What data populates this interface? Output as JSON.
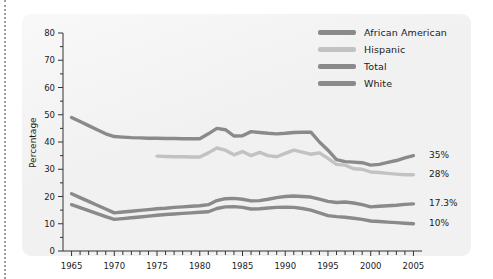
{
  "chart_data": {
    "type": "line",
    "title": "",
    "xlabel": "",
    "ylabel": "Percentage",
    "xlim": [
      1964,
      2006
    ],
    "ylim": [
      0,
      80
    ],
    "yticks": [
      0,
      10,
      20,
      30,
      40,
      50,
      60,
      70,
      80
    ],
    "xticks": [
      1965,
      1970,
      1975,
      1980,
      1985,
      1990,
      1995,
      2000,
      2005
    ],
    "xtick_labels": [
      "1965",
      "1970",
      "1975",
      "1980",
      "1985",
      "1990",
      "1995",
      "2000",
      "2005"
    ],
    "ytick_labels": [
      "0",
      "10",
      "20",
      "30",
      "40",
      "50",
      "60",
      "70",
      "80"
    ],
    "minor_xtick_step": 1,
    "grid": false,
    "legend_position": "top-right",
    "series": [
      {
        "name": "African American",
        "color": "#8a8a8a",
        "end_label": "35%",
        "x": [
          1965,
          1966,
          1967,
          1968,
          1969,
          1970,
          1971,
          1972,
          1973,
          1974,
          1975,
          1976,
          1977,
          1978,
          1979,
          1980,
          1981,
          1982,
          1983,
          1984,
          1985,
          1986,
          1987,
          1988,
          1989,
          1990,
          1991,
          1992,
          1993,
          1994,
          1995,
          1996,
          1997,
          1998,
          1999,
          2000,
          2001,
          2002,
          2003,
          2004,
          2005
        ],
        "y": [
          49.0,
          47.5,
          46.0,
          44.5,
          43.0,
          42.0,
          41.8,
          41.6,
          41.5,
          41.4,
          41.4,
          41.3,
          41.3,
          41.2,
          41.2,
          41.2,
          43.0,
          45.0,
          44.5,
          42.2,
          42.3,
          43.8,
          43.5,
          43.2,
          43.0,
          43.2,
          43.5,
          43.6,
          43.6,
          40.0,
          37.0,
          33.5,
          32.8,
          32.6,
          32.4,
          31.5,
          31.8,
          32.5,
          33.2,
          34.2,
          35.0
        ]
      },
      {
        "name": "Hispanic",
        "color": "#c2c2c2",
        "end_label": "28%",
        "x": [
          1975,
          1976,
          1977,
          1978,
          1979,
          1980,
          1981,
          1982,
          1983,
          1984,
          1985,
          1986,
          1987,
          1988,
          1989,
          1990,
          1991,
          1992,
          1993,
          1994,
          1995,
          1996,
          1997,
          1998,
          1999,
          2000,
          2001,
          2002,
          2003,
          2004,
          2005
        ],
        "y": [
          34.8,
          34.7,
          34.6,
          34.6,
          34.5,
          34.5,
          36.0,
          37.8,
          37.0,
          35.3,
          36.5,
          35.0,
          36.2,
          35.0,
          34.6,
          35.8,
          37.0,
          36.3,
          35.5,
          36.0,
          34.0,
          31.8,
          31.5,
          30.2,
          30.0,
          29.0,
          28.8,
          28.5,
          28.2,
          28.0,
          28.0
        ]
      },
      {
        "name": "Total",
        "color": "#8a8a8a",
        "end_label": "17.3%",
        "x": [
          1965,
          1966,
          1967,
          1968,
          1969,
          1970,
          1971,
          1972,
          1973,
          1974,
          1975,
          1976,
          1977,
          1978,
          1979,
          1980,
          1981,
          1982,
          1983,
          1984,
          1985,
          1986,
          1987,
          1988,
          1989,
          1990,
          1991,
          1992,
          1993,
          1994,
          1995,
          1996,
          1997,
          1998,
          1999,
          2000,
          2001,
          2002,
          2003,
          2004,
          2005
        ],
        "y": [
          21.0,
          19.6,
          18.2,
          16.8,
          15.4,
          14.0,
          14.3,
          14.6,
          14.9,
          15.2,
          15.5,
          15.7,
          16.0,
          16.2,
          16.4,
          16.6,
          17.0,
          18.5,
          19.2,
          19.3,
          19.0,
          18.4,
          18.5,
          19.0,
          19.6,
          20.0,
          20.2,
          20.0,
          19.8,
          19.0,
          18.2,
          17.8,
          18.0,
          17.6,
          17.0,
          16.2,
          16.4,
          16.6,
          16.8,
          17.1,
          17.3
        ]
      },
      {
        "name": "White",
        "color": "#8a8a8a",
        "end_label": "10%",
        "x": [
          1965,
          1966,
          1967,
          1968,
          1969,
          1970,
          1971,
          1972,
          1973,
          1974,
          1975,
          1976,
          1977,
          1978,
          1979,
          1980,
          1981,
          1982,
          1983,
          1984,
          1985,
          1986,
          1987,
          1988,
          1989,
          1990,
          1991,
          1992,
          1993,
          1994,
          1995,
          1996,
          1997,
          1998,
          1999,
          2000,
          2001,
          2002,
          2003,
          2004,
          2005
        ],
        "y": [
          17.0,
          15.9,
          14.8,
          13.7,
          12.6,
          11.6,
          11.9,
          12.2,
          12.5,
          12.8,
          13.1,
          13.4,
          13.6,
          13.8,
          14.0,
          14.2,
          14.4,
          15.6,
          16.2,
          16.3,
          16.0,
          15.4,
          15.5,
          15.8,
          16.0,
          16.1,
          16.0,
          15.6,
          15.0,
          14.0,
          13.0,
          12.6,
          12.4,
          12.0,
          11.6,
          11.0,
          10.8,
          10.6,
          10.4,
          10.2,
          10.0
        ]
      }
    ]
  },
  "legend": {
    "items": [
      {
        "label": "African American"
      },
      {
        "label": "Hispanic"
      },
      {
        "label": "Total"
      },
      {
        "label": "White"
      }
    ]
  },
  "colors": {
    "panel_background": "#f1f1f1",
    "page_background": "#ffffff",
    "axis": "#333333",
    "text": "#1b1b1b",
    "dark_line": "#8a8a8a",
    "light_line": "#c2c2c2"
  }
}
